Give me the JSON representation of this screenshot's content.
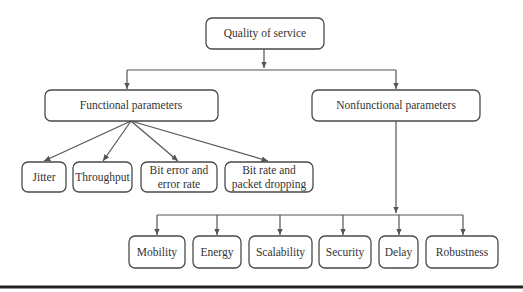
{
  "diagram": {
    "root": {
      "label": "Quality of service"
    },
    "functional": {
      "label": "Functional parameters",
      "children": [
        {
          "lines": [
            "Jitter"
          ]
        },
        {
          "lines": [
            "Throughput"
          ]
        },
        {
          "lines": [
            "Bit error and",
            "error rate"
          ]
        },
        {
          "lines": [
            "Bit rate and",
            "packet dropping"
          ]
        }
      ]
    },
    "nonfunctional": {
      "label": "Nonfunctional parameters",
      "children": [
        {
          "lines": [
            "Mobility"
          ]
        },
        {
          "lines": [
            "Energy"
          ]
        },
        {
          "lines": [
            "Scalability"
          ]
        },
        {
          "lines": [
            "Security"
          ]
        },
        {
          "lines": [
            "Delay"
          ]
        },
        {
          "lines": [
            "Robustness"
          ]
        }
      ]
    },
    "colors": {
      "stroke": "#4a4a4a",
      "text": "#333333",
      "rule": "#222222"
    }
  }
}
